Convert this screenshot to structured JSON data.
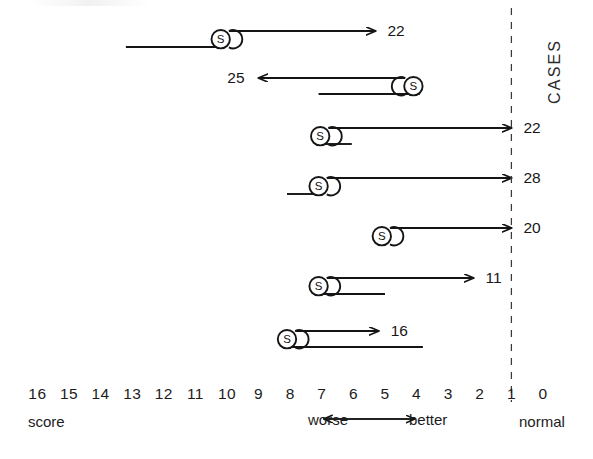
{
  "figure": {
    "background": "#ffffff",
    "ink_color": "#1a1a1a",
    "cases_axis_title": "CASES",
    "score_axis_caption": "score",
    "normal_caption": "normal",
    "worse_caption": "worse",
    "better_caption": "better",
    "marker_letter": "S"
  },
  "chart_data": {
    "type": "line",
    "title": "",
    "subtitle": "",
    "xlabel": "score",
    "ylabel": "CASES",
    "grid": false,
    "legend": "none",
    "xlim": [
      16,
      0
    ],
    "x_tick_labels": [
      "16",
      "15",
      "14",
      "13",
      "12",
      "11",
      "10",
      "9",
      "8",
      "7",
      "6",
      "5",
      "4",
      "3",
      "2",
      "1",
      "0"
    ],
    "x_ticks": [
      16,
      15,
      14,
      13,
      12,
      11,
      10,
      9,
      8,
      7,
      6,
      5,
      4,
      3,
      2,
      1,
      0
    ],
    "annotations": [
      {
        "name": "normal-reference",
        "text": "normal",
        "at_score": 1,
        "style": "dashed-vertical-line"
      },
      {
        "name": "direction-indicator",
        "left_text": "worse",
        "right_text": "better",
        "from_score": 7,
        "to_score": 4
      }
    ],
    "series": [
      {
        "name": "case-1",
        "case_value": "22",
        "marker_score": 10.2,
        "arrow_direction": "right",
        "arrow_to_score": 5.3,
        "label_side": "right",
        "baseline_from_score": 13.2,
        "baseline_to_score": 10.2,
        "has_baseline": true
      },
      {
        "name": "case-2",
        "case_value": "25",
        "marker_score": 4.1,
        "arrow_direction": "left",
        "arrow_to_score": 9.0,
        "label_side": "left",
        "baseline_from_score": 7.1,
        "baseline_to_score": 3.9,
        "has_baseline": true
      },
      {
        "name": "case-3",
        "case_value": "22",
        "marker_score": 7.05,
        "arrow_direction": "right",
        "arrow_to_score": 1.0,
        "label_side": "right",
        "baseline_from_score": 7.05,
        "baseline_to_score": 6.05,
        "has_baseline": true
      },
      {
        "name": "case-4",
        "case_value": "28",
        "marker_score": 7.1,
        "arrow_direction": "right",
        "arrow_to_score": 1.0,
        "label_side": "right",
        "baseline_from_score": 8.1,
        "baseline_to_score": 7.1,
        "has_baseline": true
      },
      {
        "name": "case-5",
        "case_value": "20",
        "marker_score": 5.1,
        "arrow_direction": "right",
        "arrow_to_score": 1.0,
        "label_side": "right",
        "baseline_from_score": 0,
        "baseline_to_score": 0,
        "has_baseline": false
      },
      {
        "name": "case-6",
        "case_value": "11",
        "marker_score": 7.1,
        "arrow_direction": "right",
        "arrow_to_score": 2.2,
        "label_side": "right",
        "baseline_from_score": 7.1,
        "baseline_to_score": 5.0,
        "has_baseline": true
      },
      {
        "name": "case-7",
        "case_value": "16",
        "marker_score": 8.1,
        "arrow_direction": "right",
        "arrow_to_score": 5.2,
        "label_side": "right",
        "baseline_from_score": 8.1,
        "baseline_to_score": 3.8,
        "has_baseline": true
      }
    ]
  }
}
